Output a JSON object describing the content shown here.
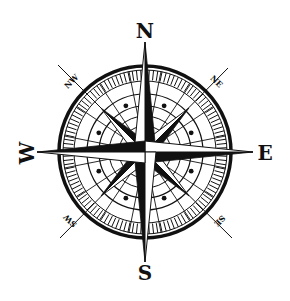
{
  "image": {
    "subject": "compass rose",
    "background": "#ffffff",
    "ink": "#111111"
  },
  "cardinal_labels": {
    "north": "N",
    "east": "E",
    "south": "S",
    "west": "W"
  },
  "intercardinal_labels": {
    "northeast": "NE",
    "southeast": "SE",
    "southwest": "SW",
    "northwest": "NW"
  },
  "geometry": {
    "center": [
      145,
      152
    ],
    "outer_ring_radius": 86,
    "tick_band": [
      71,
      82
    ],
    "inner_rings": [
      58,
      46,
      36,
      26
    ],
    "dot_radius": 50
  }
}
